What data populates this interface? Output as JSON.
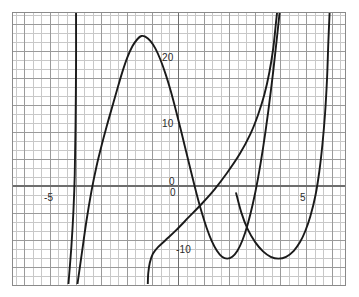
{
  "figure": {
    "title": "",
    "background_color": "#ffffff",
    "plot_area": {
      "left": 12,
      "top": 12,
      "right": 345,
      "bottom": 285
    },
    "axis_color": "#808080",
    "grid_major_color": "#9a9a9a",
    "grid_minor_color": "#c8c8c8",
    "curve_color": "#1a1a1a"
  },
  "axis_labels": {
    "x_neg5": "-5",
    "x_5": "5",
    "y_20": "20",
    "y_10": "10",
    "y_0": "0",
    "y_neg10": "-10",
    "origin_0": "0"
  },
  "chart_data": {
    "type": "line",
    "title": "",
    "xlabel": "",
    "ylabel": "",
    "xlim": [
      -6.5,
      6.5
    ],
    "ylim": [
      -16.5,
      29
    ],
    "grid": true,
    "grid_major_step": {
      "x": 1,
      "y": 4.5
    },
    "grid_minor_step": {
      "x": 0.3333,
      "y": 1.5
    },
    "legend": "none",
    "xticks": [
      -5,
      5
    ],
    "xticklabels": [
      "-5",
      "5"
    ],
    "yticks": [
      -10,
      0,
      10,
      20
    ],
    "yticklabels": [
      "-10",
      "0",
      "10",
      "20"
    ],
    "annotations": [
      {
        "text": "0",
        "x": -0.3,
        "y": 0.9,
        "note": "y-axis zero label"
      },
      {
        "text": "0",
        "x": -0.3,
        "y": -1.4,
        "note": "x-axis origin label"
      }
    ],
    "series": [
      {
        "name": "cubic",
        "type": "line",
        "color": "#1a1a1a",
        "points": [
          [
            -3.95,
            -16.5
          ],
          [
            -3.8,
            -12.0
          ],
          [
            -3.6,
            -6.0
          ],
          [
            -3.4,
            -0.9
          ],
          [
            -3.2,
            3.3
          ],
          [
            -3.0,
            6.8
          ],
          [
            -2.8,
            10.0
          ],
          [
            -2.6,
            13.0
          ],
          [
            -2.4,
            16.0
          ],
          [
            -2.2,
            18.9
          ],
          [
            -2.0,
            21.4
          ],
          [
            -1.8,
            23.3
          ],
          [
            -1.6,
            24.5
          ],
          [
            -1.45,
            25.0
          ],
          [
            -1.3,
            24.9
          ],
          [
            -1.1,
            24.2
          ],
          [
            -0.9,
            22.9
          ],
          [
            -0.7,
            21.0
          ],
          [
            -0.5,
            18.6
          ],
          [
            -0.3,
            15.8
          ],
          [
            -0.1,
            12.6
          ],
          [
            0.1,
            9.2
          ],
          [
            0.3,
            5.7
          ],
          [
            0.5,
            2.2
          ],
          [
            0.7,
            -1.2
          ],
          [
            0.9,
            -4.3
          ],
          [
            1.1,
            -7.0
          ],
          [
            1.3,
            -9.2
          ],
          [
            1.5,
            -10.8
          ],
          [
            1.7,
            -11.8
          ],
          [
            1.9,
            -12.1
          ],
          [
            2.1,
            -11.8
          ],
          [
            2.3,
            -10.8
          ],
          [
            2.5,
            -9.0
          ],
          [
            2.7,
            -6.4
          ],
          [
            2.9,
            -3.0
          ],
          [
            3.1,
            1.2
          ],
          [
            3.3,
            6.3
          ],
          [
            3.5,
            12.3
          ],
          [
            3.7,
            19.2
          ],
          [
            3.85,
            25.0
          ],
          [
            3.95,
            29.0
          ]
        ]
      },
      {
        "name": "steep-left-branch",
        "type": "line",
        "color": "#1a1a1a",
        "points": [
          [
            -4.0,
            29.0
          ],
          [
            -4.0,
            20.0
          ],
          [
            -4.02,
            10.0
          ],
          [
            -4.05,
            2.0
          ],
          [
            -4.1,
            -4.0
          ],
          [
            -4.18,
            -10.0
          ],
          [
            -4.3,
            -16.5
          ]
        ]
      },
      {
        "name": "rising-curve",
        "type": "line",
        "color": "#1a1a1a",
        "points": [
          [
            -1.2,
            -16.5
          ],
          [
            -1.18,
            -14.5
          ],
          [
            -1.12,
            -12.8
          ],
          [
            -1.0,
            -11.3
          ],
          [
            -0.8,
            -10.2
          ],
          [
            -0.5,
            -9.0
          ],
          [
            -0.1,
            -7.4
          ],
          [
            0.4,
            -5.2
          ],
          [
            0.9,
            -3.0
          ],
          [
            1.4,
            -0.6
          ],
          [
            1.9,
            2.2
          ],
          [
            2.4,
            5.4
          ],
          [
            2.8,
            8.6
          ],
          [
            3.1,
            11.8
          ],
          [
            3.35,
            15.2
          ],
          [
            3.55,
            19.0
          ],
          [
            3.7,
            23.0
          ],
          [
            3.8,
            27.0
          ],
          [
            3.85,
            29.0
          ]
        ]
      },
      {
        "name": "steep-right-branch",
        "type": "line",
        "color": "#1a1a1a",
        "points": [
          [
            5.9,
            29.0
          ],
          [
            5.85,
            24.0
          ],
          [
            5.8,
            18.0
          ],
          [
            5.72,
            12.0
          ],
          [
            5.62,
            7.0
          ],
          [
            5.5,
            2.5
          ],
          [
            5.35,
            -1.5
          ],
          [
            5.15,
            -5.0
          ],
          [
            4.95,
            -7.5
          ],
          [
            4.75,
            -9.3
          ],
          [
            4.5,
            -10.8
          ],
          [
            4.2,
            -11.8
          ],
          [
            3.9,
            -12.1
          ],
          [
            3.6,
            -11.8
          ],
          [
            3.3,
            -10.9
          ],
          [
            3.0,
            -9.4
          ],
          [
            2.7,
            -7.2
          ],
          [
            2.45,
            -4.4
          ],
          [
            2.25,
            -1.2
          ]
        ]
      }
    ]
  }
}
